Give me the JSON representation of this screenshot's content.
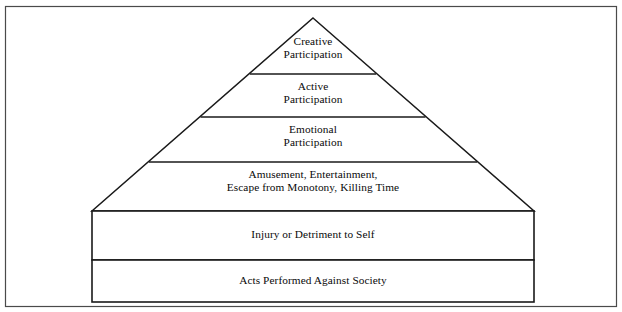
{
  "diagram": {
    "type": "pyramid",
    "shape_name": "six-tier-pyramid",
    "background_color": "#ffffff",
    "line_color": "#1a1a1a",
    "text_color": "#0a0a0a",
    "frame": {
      "x": 5,
      "y": 6,
      "width": 612,
      "height": 301
    },
    "apex": {
      "x": 313,
      "y": 18
    },
    "base_left": {
      "x": 92,
      "y": 211
    },
    "base_right": {
      "x": 534,
      "y": 211
    },
    "base_bottom": 302,
    "divider_y": [
      74,
      117,
      162,
      211,
      260
    ],
    "tiers": [
      {
        "index": 1,
        "name": "creative-participation",
        "label": "Creative\nParticipation",
        "shape": "triangle-apex"
      },
      {
        "index": 2,
        "name": "active-participation",
        "label": "Active\nParticipation",
        "shape": "trapezoid"
      },
      {
        "index": 3,
        "name": "emotional-participation",
        "label": "Emotional\nParticipation",
        "shape": "trapezoid"
      },
      {
        "index": 4,
        "name": "amusement-entertainment",
        "label": "Amusement, Entertainment,\nEscape from Monotony, Killing Time",
        "shape": "trapezoid"
      },
      {
        "index": 5,
        "name": "injury-or-detriment-to-self",
        "label": "Injury or Detriment to Self",
        "shape": "rectangle"
      },
      {
        "index": 6,
        "name": "acts-performed-against-society",
        "label": "Acts Performed Against Society",
        "shape": "rectangle"
      }
    ]
  }
}
